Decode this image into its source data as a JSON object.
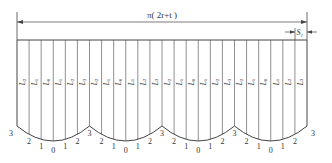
{
  "diagram": {
    "top_dimension": {
      "label": "π( 2r+t )",
      "text_pre": "π( 2",
      "var_r": "r",
      "plus": "+",
      "var_t": "t",
      "close": " )"
    },
    "gap_dimension": {
      "label": "S1",
      "base": "S",
      "sub": "1"
    },
    "column_labels": [
      "L2",
      "L1",
      "L0",
      "L1",
      "L2",
      "L3",
      "L2",
      "L1",
      "L0",
      "L1",
      "L2",
      "L3",
      "L2",
      "L1",
      "L0",
      "L1",
      "L2",
      "L3",
      "L2",
      "L1",
      "L0",
      "L1",
      "L2",
      "L3"
    ],
    "scallop_count": 4,
    "bottom_numbers": [
      "3",
      "2",
      "1",
      "0",
      "1",
      "2",
      "3",
      "2",
      "1",
      "0",
      "1",
      "2",
      "3",
      "2",
      "1",
      "0",
      "1",
      "2",
      "3",
      "2",
      "1",
      "0",
      "1",
      "2",
      "3"
    ],
    "colors": {
      "line": "#444444",
      "text": "#333333",
      "background": "#ffffff"
    }
  }
}
